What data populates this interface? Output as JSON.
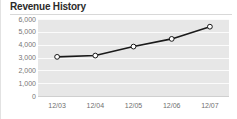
{
  "widget": {
    "title": "Revenue History"
  },
  "chart_data": {
    "type": "line",
    "title": "Revenue History",
    "xlabel": "",
    "ylabel": "",
    "categories": [
      "12/03",
      "12/04",
      "12/05",
      "12/06",
      "12/07"
    ],
    "values": [
      3050,
      3150,
      3850,
      4450,
      5400
    ],
    "series": [
      {
        "name": "Revenue",
        "values": [
          3050,
          3150,
          3850,
          4450,
          5400
        ]
      }
    ],
    "ylim": [
      0,
      6000
    ],
    "ytick_values": [
      6000,
      5000,
      4000,
      3000,
      2000,
      1000,
      0
    ],
    "ytick_labels": [
      "6,000",
      "5,000",
      "4,000",
      "3,000",
      "2,000",
      "1,000",
      "0"
    ],
    "xtick_labels": [
      "12/03",
      "12/04",
      "12/05",
      "12/06",
      "12/07"
    ],
    "grid": true,
    "legend": false,
    "legend_position": "none",
    "marker": "circle-open",
    "colors": {
      "line": "#1a1a1a",
      "marker_fill": "#ffffff",
      "marker_stroke": "#1a1a1a",
      "plot_background": "#e7e7e7",
      "gridline": "#fbfbfb",
      "title_text": "#2b2b2b",
      "tick_text": "#757575"
    }
  }
}
